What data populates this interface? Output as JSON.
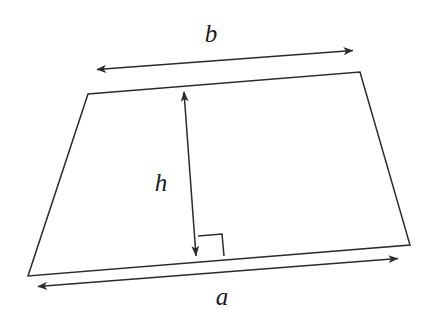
{
  "figure": {
    "kind": "geometry-diagram",
    "shape_name": "trapezoid",
    "background_color": "#ffffff",
    "stroke_color": "#2b2b2b",
    "label_color": "#1a1a1a",
    "labels": {
      "top_base": "b",
      "bottom_base": "a",
      "height": "h"
    },
    "geometry": {
      "trapezoid_vertices": [
        [
          88,
          94
        ],
        [
          360,
          72
        ],
        [
          410,
          245
        ],
        [
          28,
          276
        ]
      ],
      "height_arrow": {
        "from": [
          184,
          90
        ],
        "to": [
          196,
          258
        ],
        "double_headed": true
      },
      "right_angle_marker": {
        "corner": [
          196,
          257
        ],
        "points": [
          [
            198,
            236
          ],
          [
            222,
            234
          ],
          [
            224,
            256
          ]
        ]
      },
      "top_measure_arrow": {
        "from": [
          95,
          70
        ],
        "to": [
          355,
          50
        ],
        "double_headed": true
      },
      "bottom_measure_arrow": {
        "from": [
          36,
          287
        ],
        "to": [
          400,
          258
        ],
        "double_headed": true
      },
      "label_positions": {
        "b": [
          211,
          42
        ],
        "a": [
          222,
          303
        ],
        "h": [
          161,
          190
        ]
      }
    }
  }
}
